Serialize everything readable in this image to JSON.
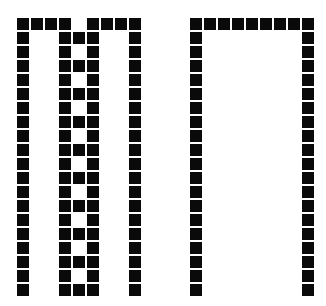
{
  "page": {
    "background_color": "#ffffff",
    "width": 326,
    "height": 306
  },
  "grid": {
    "cell_size": 12,
    "pitch": 14,
    "on_color": "#0a0a0a",
    "off_color": "#ffffff",
    "rows": 20,
    "cols": 9
  },
  "glyphs": [
    {
      "name": "glyph-m-bar-left",
      "label": "M",
      "origin_x": 17,
      "origin_y": 18,
      "rows": 20,
      "cols": 9,
      "matrix": [
        [
          1,
          1,
          1,
          1,
          0,
          1,
          1,
          1,
          1
        ],
        [
          1,
          0,
          0,
          1,
          1,
          1,
          0,
          0,
          1
        ],
        [
          1,
          0,
          0,
          1,
          0,
          1,
          0,
          0,
          1
        ],
        [
          1,
          0,
          0,
          1,
          1,
          1,
          0,
          0,
          1
        ],
        [
          1,
          0,
          0,
          1,
          0,
          1,
          0,
          0,
          1
        ],
        [
          1,
          0,
          0,
          1,
          1,
          1,
          0,
          0,
          1
        ],
        [
          1,
          0,
          0,
          1,
          0,
          1,
          0,
          0,
          1
        ],
        [
          1,
          0,
          0,
          1,
          1,
          1,
          0,
          0,
          1
        ],
        [
          1,
          0,
          0,
          1,
          0,
          1,
          0,
          0,
          1
        ],
        [
          1,
          0,
          0,
          1,
          1,
          1,
          0,
          0,
          1
        ],
        [
          1,
          0,
          0,
          1,
          0,
          1,
          0,
          0,
          1
        ],
        [
          1,
          0,
          0,
          1,
          1,
          1,
          0,
          0,
          1
        ],
        [
          1,
          0,
          0,
          1,
          0,
          1,
          0,
          0,
          1
        ],
        [
          1,
          0,
          0,
          1,
          1,
          1,
          0,
          0,
          1
        ],
        [
          1,
          0,
          0,
          1,
          0,
          1,
          0,
          0,
          1
        ],
        [
          1,
          0,
          0,
          1,
          1,
          1,
          0,
          0,
          1
        ],
        [
          1,
          0,
          0,
          1,
          0,
          1,
          0,
          0,
          1
        ],
        [
          1,
          0,
          0,
          1,
          1,
          1,
          0,
          0,
          1
        ],
        [
          1,
          0,
          0,
          1,
          0,
          1,
          0,
          0,
          1
        ],
        [
          1,
          0,
          0,
          1,
          1,
          1,
          0,
          0,
          1
        ]
      ]
    },
    {
      "name": "glyph-pi-bar-right",
      "label": "Pi",
      "origin_x": 190,
      "origin_y": 18,
      "rows": 20,
      "cols": 9,
      "matrix": [
        [
          1,
          1,
          1,
          1,
          1,
          1,
          1,
          1,
          1
        ],
        [
          1,
          0,
          0,
          0,
          0,
          0,
          0,
          0,
          1
        ],
        [
          1,
          0,
          0,
          0,
          0,
          0,
          0,
          0,
          1
        ],
        [
          1,
          0,
          0,
          0,
          0,
          0,
          0,
          0,
          1
        ],
        [
          1,
          0,
          0,
          0,
          0,
          0,
          0,
          0,
          1
        ],
        [
          1,
          0,
          0,
          0,
          0,
          0,
          0,
          0,
          1
        ],
        [
          1,
          0,
          0,
          0,
          0,
          0,
          0,
          0,
          1
        ],
        [
          1,
          0,
          0,
          0,
          0,
          0,
          0,
          0,
          1
        ],
        [
          1,
          0,
          0,
          0,
          0,
          0,
          0,
          0,
          1
        ],
        [
          1,
          0,
          0,
          0,
          0,
          0,
          0,
          0,
          1
        ],
        [
          1,
          0,
          0,
          0,
          0,
          0,
          0,
          0,
          1
        ],
        [
          1,
          0,
          0,
          0,
          0,
          0,
          0,
          0,
          1
        ],
        [
          1,
          0,
          0,
          0,
          0,
          0,
          0,
          0,
          1
        ],
        [
          1,
          0,
          0,
          0,
          0,
          0,
          0,
          0,
          1
        ],
        [
          1,
          0,
          0,
          0,
          0,
          0,
          0,
          0,
          1
        ],
        [
          1,
          0,
          0,
          0,
          0,
          0,
          0,
          0,
          1
        ],
        [
          1,
          0,
          0,
          0,
          0,
          0,
          0,
          0,
          1
        ],
        [
          1,
          0,
          0,
          0,
          0,
          0,
          0,
          0,
          1
        ],
        [
          1,
          0,
          0,
          0,
          0,
          0,
          0,
          0,
          1
        ],
        [
          1,
          0,
          0,
          0,
          0,
          0,
          0,
          0,
          1
        ]
      ]
    }
  ]
}
